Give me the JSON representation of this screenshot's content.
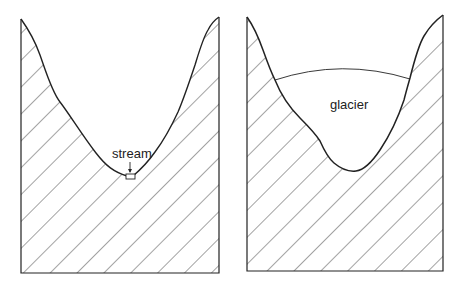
{
  "diagram": {
    "panels": [
      {
        "id": "river-valley",
        "shape": "V-shaped valley",
        "labels": [
          {
            "text": "stream",
            "x": 127,
            "y": 158
          }
        ],
        "features": [
          "stream"
        ]
      },
      {
        "id": "glacial-valley",
        "shape": "U-shaped valley",
        "labels": [
          {
            "text": "glacier",
            "x": 341,
            "y": 109
          }
        ],
        "features": [
          "glacier"
        ]
      }
    ],
    "colors": {
      "line": "#222222",
      "background": "#ffffff",
      "hatch": "#333333"
    }
  }
}
